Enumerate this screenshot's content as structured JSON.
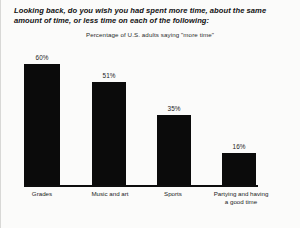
{
  "title": "Looking back, do you wish you had spent more time, about the same amount of time, or less time on each of the following:",
  "subtitle": "Percentage of U.S. adults  saying \"more time\"",
  "colors": {
    "bar": "#0b0b0b",
    "axis": "#0d0d0d",
    "background": "#fbfbfa",
    "text": "#1a1a1a"
  },
  "chart_data": {
    "type": "bar",
    "title": "Looking back, do you wish you had spent more time, about the same amount of time, or less time on each of the following:",
    "subtitle": "Percentage of U.S. adults  saying \"more time\"",
    "categories": [
      "Grades",
      "Music and art",
      "Sports",
      "Partying and having\na good time"
    ],
    "values": [
      60,
      51,
      35,
      16
    ],
    "value_labels": [
      "60%",
      "51%",
      "35%",
      "16%"
    ],
    "xlabel": "",
    "ylabel": "",
    "ylim": [
      0,
      68
    ],
    "grid": false,
    "legend": false
  }
}
